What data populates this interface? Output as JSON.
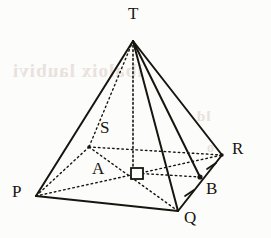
{
  "figure": {
    "kind": "square-based-pyramid",
    "name": "Pyramid T-PQRS",
    "canvas": {
      "width": 271,
      "height": 238
    },
    "background_color": "#fcfcfa",
    "ink_color": "#17150f",
    "bleed_color": "#d8ccc6"
  },
  "vertices": [
    {
      "id": "T",
      "label": "T",
      "x": 133,
      "y": 41,
      "label_x": 128,
      "label_y": 6,
      "kind": "apex",
      "dot": false
    },
    {
      "id": "P",
      "label": "P",
      "x": 36,
      "y": 196,
      "label_x": 12,
      "label_y": 183,
      "kind": "base-corner",
      "dot": false
    },
    {
      "id": "Q",
      "label": "Q",
      "x": 178,
      "y": 211,
      "label_x": 184,
      "label_y": 208,
      "kind": "base-corner",
      "dot": false
    },
    {
      "id": "R",
      "label": "R",
      "x": 222,
      "y": 155,
      "label_x": 232,
      "label_y": 140,
      "kind": "base-corner",
      "dot": false
    },
    {
      "id": "S",
      "label": "S",
      "x": 89,
      "y": 147,
      "label_x": 100,
      "label_y": 119,
      "kind": "base-corner",
      "dot": false
    },
    {
      "id": "A",
      "label": "A",
      "x": 133,
      "y": 173,
      "label_x": 92,
      "label_y": 160,
      "kind": "base-centre",
      "dot": false
    },
    {
      "id": "B",
      "label": "B",
      "x": 200,
      "y": 177,
      "label_x": 206,
      "label_y": 180,
      "kind": "edge-midpoint",
      "dot": true
    }
  ],
  "edges": [
    {
      "id": "TP",
      "from": "T",
      "to": "P",
      "style": "solid",
      "note": "lateral edge, visible"
    },
    {
      "id": "TQ",
      "from": "T",
      "to": "Q",
      "style": "solid",
      "note": "lateral edge, visible"
    },
    {
      "id": "TR",
      "from": "T",
      "to": "R",
      "style": "solid",
      "note": "lateral edge, visible"
    },
    {
      "id": "TS",
      "from": "T",
      "to": "S",
      "style": "dotted",
      "note": "lateral edge, hidden"
    },
    {
      "id": "PQ",
      "from": "P",
      "to": "Q",
      "style": "solid",
      "note": "base edge, visible"
    },
    {
      "id": "QR",
      "from": "Q",
      "to": "R",
      "style": "solid",
      "note": "base edge, visible"
    },
    {
      "id": "RS",
      "from": "R",
      "to": "S",
      "style": "dotted",
      "note": "base edge, hidden"
    },
    {
      "id": "SP",
      "from": "S",
      "to": "P",
      "style": "dotted",
      "note": "base edge, hidden"
    },
    {
      "id": "PR",
      "from": "P",
      "to": "R",
      "style": "dotted",
      "note": "base diagonal, hidden"
    },
    {
      "id": "SQ",
      "from": "S",
      "to": "Q",
      "style": "dotted",
      "note": "base diagonal, hidden"
    },
    {
      "id": "TA",
      "from": "T",
      "to": "A",
      "style": "dotted",
      "note": "vertical height of pyramid"
    },
    {
      "id": "TB",
      "from": "T",
      "to": "B",
      "style": "solid",
      "note": "slant height to midpoint of QR"
    },
    {
      "id": "AB",
      "from": "A",
      "to": "B",
      "style": "dotted",
      "note": "apothem of base square"
    }
  ],
  "markers": {
    "right_angle": {
      "id": "right-angle-at-A",
      "label": "right angle",
      "vertex": "A",
      "between": [
        "TA",
        "AB"
      ],
      "x": 133,
      "y": 173,
      "size": 11
    },
    "tick_marks": [
      {
        "id": "tick-QB",
        "on_segment": "QB",
        "x": 189,
        "y": 194,
        "count": 1,
        "meaning": "B is midpoint of QR"
      },
      {
        "id": "tick-BR",
        "on_segment": "BR",
        "x": 211,
        "y": 166,
        "count": 1,
        "meaning": "B is midpoint of QR"
      }
    ]
  },
  "bleed_through": [
    {
      "id": "bleed-line-1",
      "text": "ibaloix   laubivi",
      "x": 12,
      "y": 60,
      "size": 19
    },
    {
      "id": "bleed-line-2",
      "text": "ld",
      "x": 196,
      "y": 108,
      "size": 15
    },
    {
      "id": "bleed-line-3",
      "text": "o",
      "x": 206,
      "y": 140,
      "size": 14
    }
  ]
}
